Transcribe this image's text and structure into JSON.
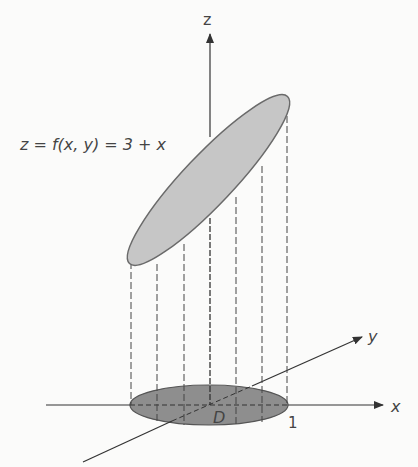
{
  "diagram": {
    "equation_label": "z = f(x, y) = 3 + x",
    "axes": {
      "z_label": "z",
      "x_label": "x",
      "y_label": "y"
    },
    "region_label": "D",
    "tick_label_x": "1",
    "colors": {
      "surface_fill": "#c4c4c4",
      "region_fill": "#8c8c8c",
      "stroke": "#555555",
      "axis": "#333333"
    }
  }
}
